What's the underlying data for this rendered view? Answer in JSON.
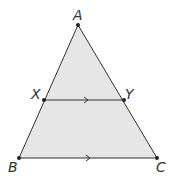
{
  "diagram": {
    "type": "geometry-triangle",
    "fill_color": "#e6e6e6",
    "stroke_color": "#333333",
    "points": {
      "A": {
        "label": "A",
        "x": 78,
        "y": 25
      },
      "B": {
        "label": "B",
        "x": 19,
        "y": 158
      },
      "C": {
        "label": "C",
        "x": 157,
        "y": 158
      },
      "X": {
        "label": "X",
        "x": 44,
        "y": 100
      },
      "Y": {
        "label": "Y",
        "x": 124,
        "y": 100
      }
    },
    "parallel_segments": [
      "XY",
      "BC"
    ]
  }
}
